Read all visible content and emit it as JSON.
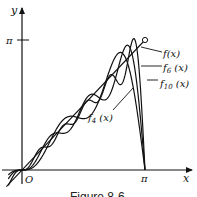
{
  "chart_data": {
    "type": "line",
    "title": "",
    "caption": "Figure 8-6",
    "xlabel": "x",
    "ylabel": "y",
    "origin_label": "O",
    "x_ticks": [
      {
        "value": 3.14159,
        "label": "π"
      }
    ],
    "y_ticks": [
      {
        "value": 3.14159,
        "label": "π"
      }
    ],
    "xlim": [
      -0.5,
      4.3
    ],
    "ylim": [
      -0.4,
      4.0
    ],
    "grid": false,
    "legend_position": "annotations-right",
    "series": [
      {
        "name": "f(x)",
        "label": "f(x)",
        "kind": "target",
        "formula": "x",
        "domain": [
          -0.4,
          3.14159
        ],
        "open_endpoint": [
          3.14159,
          3.14159
        ]
      },
      {
        "name": "f4(x)",
        "label_main": "f",
        "label_sub": "4",
        "label_tail": " (x)",
        "kind": "fourier_partial_sum",
        "terms": 4
      },
      {
        "name": "f6(x)",
        "label_main": "f",
        "label_sub": "6",
        "label_tail": " (x)",
        "kind": "fourier_partial_sum",
        "terms": 6
      },
      {
        "name": "f10(x)",
        "label_main": "f",
        "label_sub": "10",
        "label_tail": " (x)",
        "kind": "fourier_partial_sum",
        "terms": 10
      }
    ]
  }
}
